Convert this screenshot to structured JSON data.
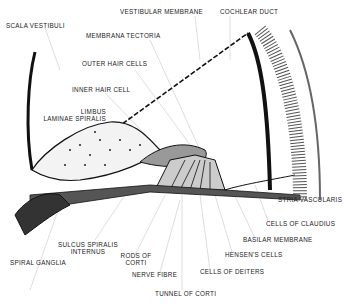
{
  "figure": {
    "labels": {
      "scala_vestibuli": "SCALA VESTIBULI",
      "vestibular_membrane": "VESTIBULAR MEMBRANE",
      "cochlear_duct": "COCHLEAR DUCT",
      "membrana_tectoria": "MEMBRANA TECTORIA",
      "outer_hair_cells": "OUTER HAIR CELLS",
      "inner_hair_cell": "INNER HAIR CELL",
      "limbus_1": "LIMBUS",
      "limbus_2": "LAMINAE SPIRALIS",
      "stria_vascularis": "STRIA VASCULARIS",
      "cells_of_claudius": "CELLS OF CLAUDIUS",
      "basilar_membrane": "BASILAR MEMBRANE",
      "hensens_cells": "HENSEN'S CELLS",
      "cells_of_deiters": "CELLS OF DEITERS",
      "tunnel_of_corti": "TUNNEL OF CORTI",
      "nerve_fibre": "NERVE FIBRE",
      "rods_of_corti_1": "RODS OF",
      "rods_of_corti_2": "CORTI",
      "sulcus_1": "SULCUS SPIRALIS",
      "sulcus_2": "INTERNUS",
      "spiral_ganglia": "SPIRAL GANGLIA"
    }
  }
}
